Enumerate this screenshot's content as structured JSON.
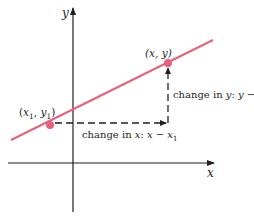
{
  "diagram": {
    "axes": {
      "x_label": "x",
      "y_label": "y"
    },
    "line": {
      "color": "#e8607a"
    },
    "points": [
      {
        "id": "p1",
        "label_open": "(",
        "label_var1": "x",
        "label_sub1": "1",
        "label_sep": ", ",
        "label_var2": "y",
        "label_sub2": "1",
        "label_close": ")"
      },
      {
        "id": "p2",
        "label": "(x, y)"
      }
    ],
    "annotations": {
      "change_x_prefix": "change in ",
      "change_x_var": "x",
      "change_x_colon": ": ",
      "change_x_expr_a": "x",
      "change_x_minus": " − ",
      "change_x_expr_b": "x",
      "change_x_sub": "1",
      "change_y_prefix": "change in ",
      "change_y_var": "y",
      "change_y_colon": ": ",
      "change_y_expr_a": "y",
      "change_y_minus": " − ",
      "change_y_expr_b": "y",
      "change_y_sub": "1"
    },
    "colors": {
      "axis": "#231f20",
      "line": "#e8607a",
      "point": "#e8607a",
      "dash": "#231f20"
    }
  }
}
